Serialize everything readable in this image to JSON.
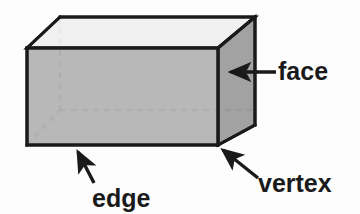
{
  "figure": {
    "background_color": "#fdfdfd"
  },
  "solid": {
    "name": "rectangular prism",
    "colors": {
      "outline": "#1a1a1a",
      "top_face_fill": "#efefef",
      "front_face_fill": "#b2b2b2",
      "right_face_fill": "#9a9a9a",
      "hidden_edge": "#8c8c8c"
    },
    "faces": [
      {
        "name": "top-face",
        "points": "27,48 60,17 255,17 218,48",
        "fill": "#efefef"
      },
      {
        "name": "front-face",
        "points": "27,48 218,48 218,145 27,145",
        "fill": "#b2b2b2"
      },
      {
        "name": "right-face",
        "points": "218,48 255,17 255,125 218,145",
        "fill": "#9a9a9a"
      }
    ],
    "hidden_edges": [
      {
        "name": "hidden-vertical-edge",
        "x1": 60,
        "y1": 17,
        "x2": 60,
        "y2": 110
      },
      {
        "name": "hidden-back-bottom-edge",
        "x1": 60,
        "y1": 110,
        "x2": 255,
        "y2": 110
      },
      {
        "name": "hidden-diagonal-edge",
        "x1": 27,
        "y1": 145,
        "x2": 60,
        "y2": 110
      }
    ]
  },
  "labels": [
    {
      "id": "face",
      "text": "face",
      "x": 278,
      "y": 80,
      "font_size": 25,
      "anchor": "start",
      "target": "right-face"
    },
    {
      "id": "vertex",
      "text": "vertex",
      "x": 258,
      "y": 192,
      "font_size": 25,
      "anchor": "start",
      "target": "front-bottom-right-vertex"
    },
    {
      "id": "edge",
      "text": "edge",
      "x": 92,
      "y": 207,
      "font_size": 25,
      "anchor": "start",
      "target": "front-bottom-edge"
    }
  ],
  "pointers": [
    {
      "id": "face-pointer",
      "from_x": 276,
      "from_y": 72,
      "to_x": 230,
      "to_y": 72,
      "stroke": "#1a1a1a"
    },
    {
      "id": "vertex-pointer",
      "from_x": 258,
      "from_y": 178,
      "to_x": 221,
      "to_y": 148,
      "stroke": "#1a1a1a"
    },
    {
      "id": "edge-pointer",
      "from_x": 94,
      "from_y": 183,
      "to_x": 77,
      "to_y": 150,
      "stroke": "#1a1a1a"
    }
  ]
}
